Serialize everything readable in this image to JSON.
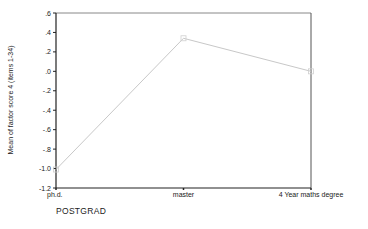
{
  "chart_data": {
    "type": "line",
    "title": "",
    "xlabel": "POSTGRAD",
    "ylabel": "Mean of factor score 4 (items 1-34)",
    "categories": [
      "ph.d.",
      "master",
      "4 Year maths degree"
    ],
    "series": [
      {
        "name": "Mean of factor score 4 (items 1-34)",
        "values": [
          -1.01,
          0.34,
          0.0
        ]
      }
    ],
    "ylim": [
      -1.2,
      0.6
    ],
    "yticks": [
      0.6,
      0.4,
      0.2,
      0.0,
      -0.2,
      -0.4,
      -0.6,
      -0.8,
      -1.0,
      -1.2
    ],
    "ytick_labels": [
      ".6",
      ".4",
      ".2",
      ".0",
      "-.2",
      "-.4",
      "-.6",
      "-.8",
      "-1.0",
      "-1.2"
    ],
    "grid": false,
    "legend": "none",
    "colors": {
      "line": "#c8c8c8",
      "axis": "#333333"
    }
  }
}
